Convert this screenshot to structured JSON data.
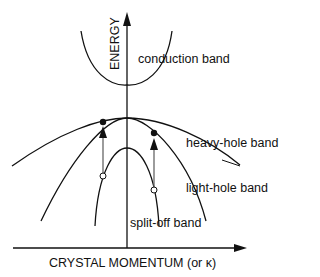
{
  "diagram": {
    "y_axis_label": "ENERGY",
    "x_axis_label": "CRYSTAL MOMENTUM (or κ)",
    "bands": {
      "conduction": "conduction band",
      "heavy_hole": "heavy-hole band",
      "light_hole": "light-hole band",
      "split_off": "split-off band"
    },
    "markers": {
      "filled_circles": 2,
      "open_circles": 2,
      "transition_arrows": 2
    }
  }
}
